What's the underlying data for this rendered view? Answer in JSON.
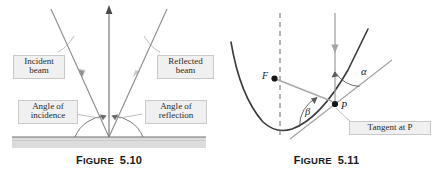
{
  "page": {
    "background_color": "#ffffff",
    "width": 435,
    "height": 172
  },
  "figures": [
    {
      "id": "figure-5-10",
      "caption_word": "Figure",
      "caption_number": "5.10",
      "subject": "Law of reflection: incident beam, normal, reflected beam on a surface",
      "labels": {
        "incident_beam_line1": "Incident",
        "incident_beam_line2": "beam",
        "reflected_beam_line1": "Reflected",
        "reflected_beam_line2": "beam",
        "angle_of_incidence_line1": "Angle of",
        "angle_of_incidence_line2": "incidence",
        "angle_of_reflection_line1": "Angle of",
        "angle_of_reflection_line2": "reflection"
      },
      "colors": {
        "beam": "#8c8c8c",
        "normal": "#6e6e6e",
        "surface_fill": "#d8d8d8",
        "surface_line": "#6f6f6f",
        "callout_fill": "#f0f0f0",
        "callout_border": "#c9c9c9"
      }
    },
    {
      "id": "figure-5-11",
      "caption_word": "Figure",
      "caption_number": "5.11",
      "subject": "Reflection property of a parabola: focus F, point P, tangent at P, angles alpha and beta",
      "labels": {
        "focus": "F",
        "point": "P",
        "alpha": "α",
        "beta": "β",
        "tangent": "Tangent at P"
      },
      "colors": {
        "parabola": "#3a3a3a",
        "axis_dashed": "#6b6b6b",
        "incoming_ray": "#9a9a9a",
        "focal_ray": "#a0a0a0",
        "tangent_line": "#9a9a9a",
        "arc": "#5a5a5a",
        "point_fill": "#1a1a1a",
        "callout_fill": "#f0f0f0",
        "callout_border": "#c9c9c9"
      }
    }
  ]
}
